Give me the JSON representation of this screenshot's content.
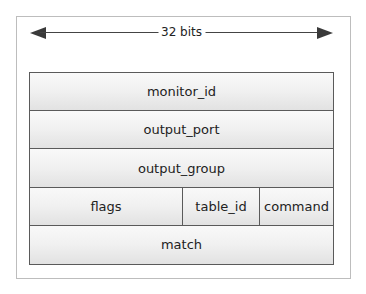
{
  "diagram": {
    "width_label": "32 bits",
    "rows": [
      {
        "fields": [
          {
            "name": "monitor_id",
            "span": 32
          }
        ]
      },
      {
        "fields": [
          {
            "name": "output_port",
            "span": 32
          }
        ]
      },
      {
        "fields": [
          {
            "name": "output_group",
            "span": 32
          }
        ]
      },
      {
        "fields": [
          {
            "name": "flags",
            "span": 16
          },
          {
            "name": "table_id",
            "span": 8
          },
          {
            "name": "command",
            "span": 8
          }
        ]
      },
      {
        "fields": [
          {
            "name": "match",
            "span": 32
          }
        ]
      }
    ]
  }
}
